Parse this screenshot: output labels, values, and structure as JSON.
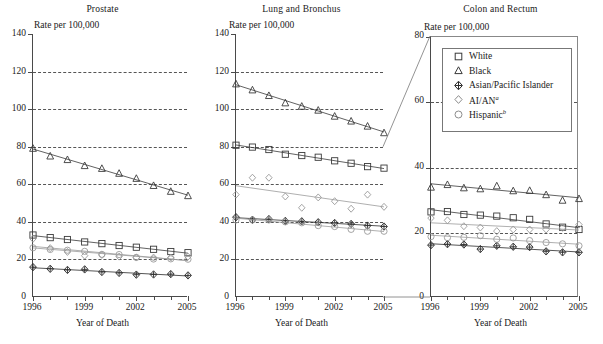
{
  "figure": {
    "xaxis_title": "Year of Death",
    "rate_label": "Rate per 100,000"
  },
  "legend": {
    "items": [
      {
        "label": "White",
        "marker": "square-open-marker"
      },
      {
        "label": "Black",
        "marker": "triangle-open-marker"
      },
      {
        "label": "Asian/Pacific Islander",
        "marker": "diamond-cross-marker"
      },
      {
        "label": "AI/AN",
        "sup": "a",
        "marker": "diamond-open-marker"
      },
      {
        "label": "Hispanic",
        "sup": "b",
        "marker": "circle-open-marker"
      }
    ]
  },
  "chart_data": [
    {
      "type": "line",
      "title": "Prostate",
      "xlabel": "Year of Death",
      "ylabel": "Rate per 100,000",
      "x": [
        1996,
        1997,
        1998,
        1999,
        2000,
        2001,
        2002,
        2003,
        2004,
        2005
      ],
      "xlim": [
        1996,
        2005
      ],
      "ylim": [
        0,
        140
      ],
      "yticks": [
        0,
        20,
        40,
        60,
        80,
        100,
        120,
        140
      ],
      "xticks": [
        1996,
        1999,
        2002,
        2005
      ],
      "grid": true,
      "series": [
        {
          "name": "White",
          "marker": "square",
          "values": [
            33.0,
            31.6,
            30.6,
            29.3,
            28.4,
            27.4,
            26.5,
            25.4,
            24.2,
            23.6
          ]
        },
        {
          "name": "Black",
          "marker": "triangle",
          "values": [
            79.2,
            75.1,
            73.2,
            70.0,
            68.5,
            65.9,
            63.2,
            59.4,
            56.3,
            54.0
          ]
        },
        {
          "name": "Asian/Pacific Islander",
          "marker": "diamond-cross",
          "values": [
            15.9,
            15.0,
            14.4,
            14.7,
            13.3,
            12.8,
            11.9,
            12.0,
            12.2,
            11.5
          ]
        },
        {
          "name": "AI/AN",
          "marker": "diamond",
          "values": [
            31.0,
            26.0,
            24.0,
            22.0,
            22.4,
            21.5,
            21.0,
            21.0,
            21.0,
            21.5
          ]
        },
        {
          "name": "Hispanic",
          "marker": "circle",
          "values": [
            26.2,
            25.3,
            24.9,
            24.3,
            22.7,
            22.6,
            21.1,
            20.2,
            20.3,
            20.1
          ]
        }
      ]
    },
    {
      "type": "line",
      "title": "Lung and Bronchus",
      "xlabel": "Year of Death",
      "ylabel": "Rate per 100,000",
      "x": [
        1996,
        1997,
        1998,
        1999,
        2000,
        2001,
        2002,
        2003,
        2004,
        2005
      ],
      "xlim": [
        1996,
        2005
      ],
      "ylim": [
        0,
        140
      ],
      "yticks": [
        0,
        20,
        40,
        60,
        80,
        100,
        120,
        140
      ],
      "xticks": [
        1996,
        1999,
        2002,
        2005
      ],
      "grid": true,
      "series": [
        {
          "name": "White",
          "marker": "square",
          "values": [
            80.8,
            79.8,
            78.5,
            76.0,
            75.3,
            74.4,
            72.5,
            71.2,
            69.4,
            68.6
          ]
        },
        {
          "name": "Black",
          "marker": "triangle",
          "values": [
            113.5,
            110.3,
            107.3,
            103.4,
            101.6,
            99.5,
            96.3,
            93.7,
            91.0,
            87.5
          ]
        },
        {
          "name": "Asian/Pacific Islander",
          "marker": "diamond-cross",
          "values": [
            42.5,
            41.1,
            41.5,
            40.5,
            40.3,
            39.8,
            39.4,
            38.9,
            38.0,
            37.5
          ]
        },
        {
          "name": "AI/AN",
          "marker": "diamond",
          "values": [
            54.5,
            63.5,
            63.5,
            53.5,
            47.5,
            53.0,
            51.0,
            47.0,
            54.5,
            48.0
          ]
        },
        {
          "name": "Hispanic",
          "marker": "circle",
          "values": [
            41.0,
            41.0,
            41.0,
            40.0,
            39.5,
            38.0,
            37.5,
            36.0,
            35.0,
            35.0
          ]
        }
      ]
    },
    {
      "type": "line",
      "title": "Colon and Rectum",
      "xlabel": "Year of Death",
      "ylabel": "Rate per 100,000",
      "x": [
        1996,
        1997,
        1998,
        1999,
        2000,
        2001,
        2002,
        2003,
        2004,
        2005
      ],
      "xlim": [
        1996,
        2005
      ],
      "ylim": [
        0,
        80
      ],
      "yticks": [
        0,
        20,
        40,
        60,
        80
      ],
      "xticks": [
        1996,
        1999,
        2002,
        2005
      ],
      "grid": true,
      "series": [
        {
          "name": "White",
          "marker": "square",
          "values": [
            26.4,
            26.5,
            25.6,
            25.4,
            25.1,
            24.6,
            24.1,
            22.7,
            21.7,
            21.0
          ]
        },
        {
          "name": "Black",
          "marker": "triangle",
          "values": [
            34.0,
            34.8,
            33.8,
            33.5,
            34.4,
            32.9,
            33.0,
            31.7,
            30.0,
            30.5
          ]
        },
        {
          "name": "Asian/Pacific Islander",
          "marker": "diamond-cross",
          "values": [
            16.2,
            16.5,
            16.4,
            15.0,
            16.0,
            15.7,
            15.6,
            14.3,
            14.0,
            14.0
          ]
        },
        {
          "name": "AI/AN",
          "marker": "diamond",
          "values": [
            24.5,
            23.8,
            22.0,
            21.6,
            20.5,
            21.0,
            21.0,
            21.0,
            21.5,
            22.5
          ]
        },
        {
          "name": "Hispanic",
          "marker": "circle",
          "values": [
            18.8,
            18.5,
            18.6,
            19.1,
            18.0,
            18.4,
            17.6,
            17.0,
            16.6,
            16.0
          ]
        }
      ]
    }
  ]
}
